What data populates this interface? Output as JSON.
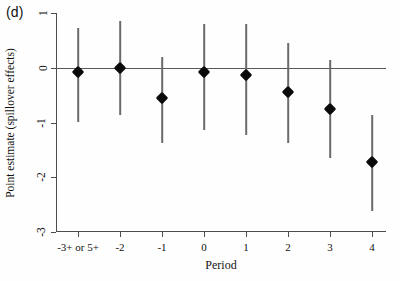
{
  "panel": {
    "label": "(d)"
  },
  "chart_data": {
    "type": "scatter",
    "title": "",
    "xlabel": "Period",
    "ylabel": "Point estimate (spillover effects)",
    "categories": [
      "-3+ or 5+",
      "-2",
      "-1",
      "0",
      "1",
      "2",
      "3",
      "4"
    ],
    "xtick_labels": [
      "-3+ or 5+",
      "-2",
      "-1",
      "0",
      "1",
      "2",
      "3",
      "4"
    ],
    "ytick_labels": [
      "1",
      "0",
      "-1",
      "-2",
      "-3"
    ],
    "ytick_values": [
      1,
      0,
      -1,
      -2,
      -3
    ],
    "ylim": [
      -3,
      1
    ],
    "grid": false,
    "legend": "none",
    "zero_line": true,
    "marker": "filled-diamond",
    "error_bar_style": "vertical-line",
    "values": [
      -0.07,
      0.0,
      -0.56,
      -0.08,
      -0.13,
      -0.45,
      -0.76,
      -1.72
    ],
    "ci_low": [
      -1.0,
      -0.86,
      -1.37,
      -1.13,
      -1.22,
      -1.37,
      -1.64,
      -2.62
    ],
    "ci_high": [
      0.73,
      0.86,
      0.2,
      0.8,
      0.8,
      0.45,
      0.15,
      -0.87
    ],
    "points": [
      {
        "x_label": "-3+ or 5+",
        "estimate": -0.07,
        "ci_low": -1.0,
        "ci_high": 0.73
      },
      {
        "x_label": "-2",
        "estimate": 0.0,
        "ci_low": -0.86,
        "ci_high": 0.86
      },
      {
        "x_label": "-1",
        "estimate": -0.56,
        "ci_low": -1.37,
        "ci_high": 0.2
      },
      {
        "x_label": "0",
        "estimate": -0.08,
        "ci_low": -1.13,
        "ci_high": 0.8
      },
      {
        "x_label": "1",
        "estimate": -0.13,
        "ci_low": -1.22,
        "ci_high": 0.8
      },
      {
        "x_label": "2",
        "estimate": -0.45,
        "ci_low": -1.37,
        "ci_high": 0.45
      },
      {
        "x_label": "3",
        "estimate": -0.76,
        "ci_low": -1.64,
        "ci_high": 0.15
      },
      {
        "x_label": "4",
        "estimate": -1.72,
        "ci_low": -2.62,
        "ci_high": -0.87
      }
    ],
    "colors": {
      "marker": "#0a0a0a",
      "error_bar": "#6b6b6e",
      "axis": "#4d4d4d",
      "zero_line": "#58585a",
      "background": "#fefefe",
      "text": "#111111"
    }
  }
}
